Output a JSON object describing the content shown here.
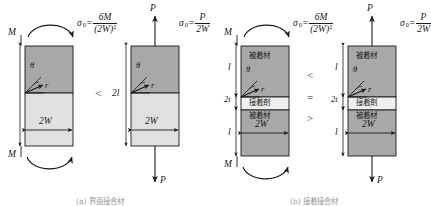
{
  "figure": {
    "colors": {
      "adherend_dark": "#a8a8a8",
      "adherend_light": "#e0e0e0",
      "adhesive": "#efefef",
      "outline": "#1a1a1a",
      "caption_gray": "#9a9a9a"
    }
  },
  "panels": [
    {
      "id": "panel-a",
      "caption": "(a)  界面接合材",
      "specimens": [
        {
          "id": "spec-1",
          "load_type": "moment",
          "load_label_top": "M",
          "load_label_bottom": "M",
          "stress_formula": {
            "symbol": "σ",
            "subscript": "0",
            "equals": "=",
            "numerator": "6M",
            "denominator": "(2W)",
            "denominator_exponent": "2"
          },
          "width_label": "2W",
          "height_label": "",
          "crack_angle_label": "θ",
          "crack_radius_label": "r",
          "layers": [
            {
              "name": "upper-block",
              "label": "",
              "fill": "dark"
            },
            {
              "name": "lower-block",
              "label": "",
              "fill": "light"
            }
          ]
        },
        {
          "id": "spec-2",
          "load_type": "tension",
          "load_label_top": "P",
          "load_label_bottom": "P",
          "stress_formula": {
            "symbol": "σ",
            "subscript": "0",
            "equals": "=",
            "numerator": "P",
            "denominator": "2W",
            "denominator_exponent": ""
          },
          "width_label": "2W",
          "height_label": "2l",
          "crack_angle_label": "θ",
          "crack_radius_label": "r",
          "layers": [
            {
              "name": "upper-block",
              "label": "",
              "fill": "dark"
            },
            {
              "name": "lower-block",
              "label": "",
              "fill": "light"
            }
          ]
        }
      ],
      "comparison": [
        "<"
      ]
    },
    {
      "id": "panel-b",
      "caption": "(b)  接着接合材",
      "specimens": [
        {
          "id": "spec-3",
          "load_type": "moment",
          "load_label_top": "M",
          "load_label_bottom": "M",
          "stress_formula": {
            "symbol": "σ",
            "subscript": "0",
            "equals": "=",
            "numerator": "6M",
            "denominator": "(2W)",
            "denominator_exponent": "2"
          },
          "width_label": "2W",
          "dim_upper": "l",
          "dim_mid": "2t",
          "dim_lower": "l",
          "crack_angle_label": "θ",
          "crack_radius_label": "r",
          "layers": [
            {
              "name": "upper-adherend",
              "label": "被着材",
              "fill": "dark"
            },
            {
              "name": "adhesive",
              "label": "接着剤",
              "fill": "adhesive"
            },
            {
              "name": "lower-adherend",
              "label": "被着材",
              "fill": "dark"
            }
          ]
        },
        {
          "id": "spec-4",
          "load_type": "tension",
          "load_label_top": "P",
          "load_label_bottom": "P",
          "stress_formula": {
            "symbol": "σ",
            "subscript": "0",
            "equals": "=",
            "numerator": "P",
            "denominator": "2W",
            "denominator_exponent": ""
          },
          "width_label": "2W",
          "dim_upper": "l",
          "dim_mid": "2t",
          "dim_lower": "l",
          "crack_angle_label": "θ",
          "crack_radius_label": "r",
          "layers": [
            {
              "name": "upper-adherend",
              "label": "被着材",
              "fill": "dark"
            },
            {
              "name": "adhesive",
              "label": "接着剤",
              "fill": "adhesive"
            },
            {
              "name": "lower-adherend",
              "label": "被着材",
              "fill": "dark"
            }
          ]
        }
      ],
      "comparison": [
        "<",
        "=",
        ">"
      ]
    }
  ]
}
